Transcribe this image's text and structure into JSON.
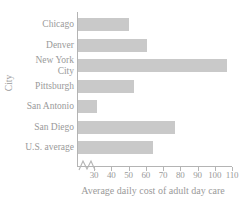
{
  "chart_data": {
    "type": "bar",
    "orientation": "horizontal",
    "title": "",
    "xlabel": "Average daily cost of adult day care",
    "ylabel": "City",
    "categories": [
      "Chicago",
      "Denver",
      "New York City",
      "Pittsburgh",
      "San Antonio",
      "San Diego",
      "U.S. average"
    ],
    "values": [
      50,
      61,
      107,
      53,
      32,
      77,
      64
    ],
    "xticks": [
      30,
      40,
      50,
      60,
      70,
      80,
      90,
      100,
      110
    ],
    "xtick_labels": [
      "30",
      "40",
      "50",
      "60",
      "70",
      "80",
      "90",
      "100",
      "110"
    ],
    "xlim": [
      25,
      110
    ],
    "axis_break": true,
    "grid": false,
    "legend": false,
    "bar_color": "#c9c9c9",
    "axis_color": "#b4b4b4",
    "text_color": "#9a9a9a"
  },
  "category_label_lines": [
    "Chicago",
    "Denver",
    "New York\nCity",
    "Pittsburgh",
    "San Antonio",
    "San Diego",
    "U.S. average"
  ]
}
